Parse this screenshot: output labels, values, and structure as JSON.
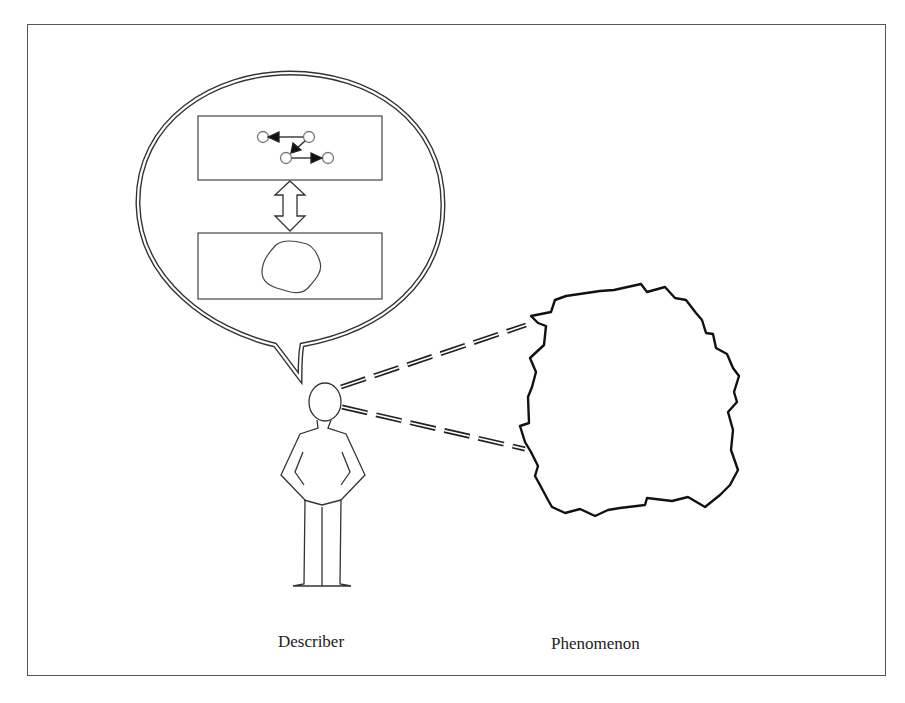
{
  "figure": {
    "labels": {
      "describer": "Describer",
      "phenomenon": "Phenomenon"
    },
    "elements": {
      "speech_bubble": "thought-bubble containing two linked representations",
      "upper_box": "graph of nodes connected by arrows (formal model)",
      "lower_box": "blob shape (mental image)",
      "connector": "double-headed hollow arrow between boxes",
      "person": "stick-outline human figure (describer)",
      "sight_lines": "two dashed lines from describer's eye to phenomenon",
      "phenomenon_shape": "irregular jagged outline"
    },
    "colors": {
      "stroke": "#222222",
      "frame": "#555555",
      "background": "#ffffff"
    }
  }
}
